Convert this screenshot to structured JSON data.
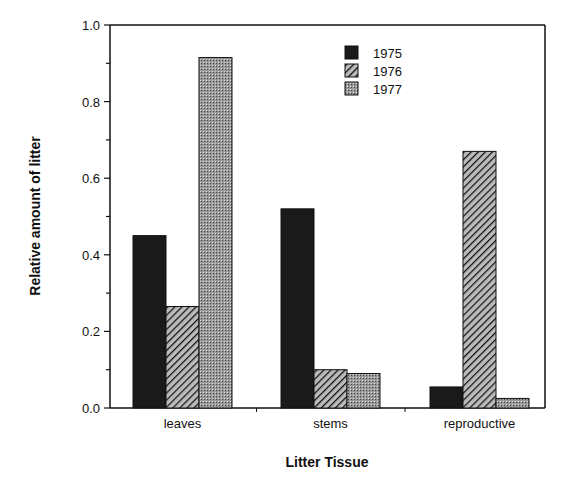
{
  "chart_data": {
    "type": "bar",
    "title": "",
    "xlabel": "Litter Tissue",
    "ylabel": "Relative amount of litter",
    "ylim": [
      0,
      1.0
    ],
    "yticks": [
      "0.0",
      "0.2",
      "0.4",
      "0.6",
      "0.8",
      "1.0"
    ],
    "categories": [
      "leaves",
      "stems",
      "reproductive"
    ],
    "series": [
      {
        "name": "1975",
        "pattern": "solid",
        "values": [
          0.45,
          0.52,
          0.055
        ]
      },
      {
        "name": "1976",
        "pattern": "hatch",
        "values": [
          0.265,
          0.1,
          0.67
        ]
      },
      {
        "name": "1977",
        "pattern": "stipple",
        "values": [
          0.915,
          0.09,
          0.025
        ]
      }
    ],
    "legend_position": "upper right inside",
    "grid": false
  }
}
